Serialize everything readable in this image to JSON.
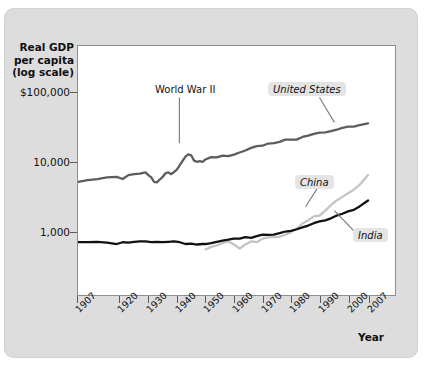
{
  "figure": {
    "background_color": "#dddddd",
    "plot_background_color": "#ffffff"
  },
  "chart_data": {
    "type": "line",
    "title": "",
    "subtitle": "",
    "ylabel": "Real GDP per capita (log scale)",
    "xlabel": "Year",
    "y_scale": "log",
    "grid": false,
    "legend_position": "inline-callouts",
    "ylim": [
      400,
      100000
    ],
    "xlim": [
      1907,
      2007
    ],
    "ytick_labels": [
      "$100,000",
      "10,000",
      "1,000"
    ],
    "ytick_values": [
      100000,
      10000,
      1000
    ],
    "xtick_labels": [
      "1907",
      "1920",
      "1930",
      "1940",
      "1950",
      "1960",
      "1970",
      "1980",
      "1990",
      "2000",
      "2007"
    ],
    "xtick_values": [
      1907,
      1920,
      1930,
      1940,
      1950,
      1960,
      1970,
      1980,
      1990,
      2000,
      2007
    ],
    "annotations": [
      {
        "text": "World War II",
        "x": 1944,
        "y": 13000,
        "style": "plain"
      }
    ],
    "series": [
      {
        "name": "United States",
        "color": "#5d5d5d",
        "label_position": "upper-right",
        "x": [
          1907,
          1910,
          1913,
          1916,
          1919,
          1921,
          1923,
          1925,
          1927,
          1929,
          1930,
          1931,
          1932,
          1933,
          1934,
          1935,
          1936,
          1937,
          1938,
          1939,
          1940,
          1941,
          1942,
          1943,
          1944,
          1945,
          1946,
          1947,
          1948,
          1949,
          1950,
          1952,
          1954,
          1956,
          1958,
          1960,
          1962,
          1964,
          1966,
          1968,
          1970,
          1972,
          1974,
          1976,
          1978,
          1980,
          1982,
          1984,
          1986,
          1988,
          1990,
          1992,
          1994,
          1996,
          1998,
          2000,
          2002,
          2004,
          2007
        ],
        "values": [
          5200,
          5500,
          5700,
          6000,
          6100,
          5700,
          6500,
          6700,
          6800,
          7100,
          6500,
          6000,
          5200,
          5100,
          5600,
          6100,
          6900,
          7100,
          6700,
          7200,
          7800,
          9000,
          10400,
          12000,
          12900,
          12500,
          10500,
          10100,
          10300,
          10100,
          10900,
          11800,
          11700,
          12400,
          12200,
          12800,
          13700,
          14700,
          16000,
          17000,
          17200,
          18500,
          18800,
          19500,
          21000,
          21000,
          21000,
          23000,
          24000,
          25500,
          26500,
          26800,
          28000,
          29200,
          31000,
          32500,
          32500,
          34000,
          36000
        ]
      },
      {
        "name": "China",
        "color": "#c4c4c4",
        "label_position": "mid-right",
        "x": [
          1950,
          1952,
          1954,
          1956,
          1958,
          1960,
          1962,
          1964,
          1966,
          1968,
          1970,
          1972,
          1974,
          1976,
          1978,
          1980,
          1982,
          1984,
          1986,
          1988,
          1990,
          1992,
          1994,
          1996,
          1998,
          2000,
          2002,
          2004,
          2007
        ],
        "values": [
          550,
          600,
          630,
          680,
          720,
          650,
          570,
          650,
          720,
          700,
          790,
          820,
          830,
          840,
          900,
          980,
          1100,
          1300,
          1450,
          1650,
          1700,
          2000,
          2400,
          2800,
          3150,
          3550,
          4000,
          4700,
          6500
        ]
      },
      {
        "name": "India",
        "color": "#111111",
        "label_position": "lower-right",
        "x": [
          1907,
          1910,
          1913,
          1916,
          1919,
          1921,
          1923,
          1925,
          1927,
          1929,
          1931,
          1933,
          1935,
          1937,
          1939,
          1941,
          1943,
          1945,
          1947,
          1949,
          1950,
          1952,
          1954,
          1956,
          1958,
          1960,
          1962,
          1964,
          1966,
          1968,
          1970,
          1972,
          1974,
          1976,
          1978,
          1980,
          1982,
          1984,
          1986,
          1988,
          1990,
          1992,
          1994,
          1996,
          1998,
          2000,
          2002,
          2004,
          2007
        ],
        "values": [
          700,
          700,
          710,
          690,
          660,
          700,
          690,
          710,
          720,
          720,
          700,
          710,
          700,
          710,
          720,
          700,
          660,
          670,
          650,
          660,
          660,
          680,
          710,
          740,
          760,
          790,
          790,
          830,
          810,
          860,
          900,
          890,
          900,
          950,
          1000,
          1020,
          1080,
          1150,
          1220,
          1320,
          1400,
          1450,
          1550,
          1700,
          1800,
          1950,
          2050,
          2300,
          2800
        ]
      }
    ]
  },
  "labels": {
    "y_axis_title_lines": [
      "Real GDP",
      "per capita",
      "(log scale)"
    ],
    "x_axis_title": "Year",
    "united_states": "United States",
    "china": "China",
    "india": "India",
    "world_war_ii": "World War II"
  }
}
